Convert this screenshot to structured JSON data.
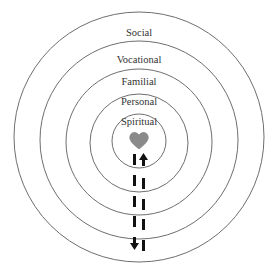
{
  "diagram": {
    "type": "concentric-circles",
    "rings": [
      {
        "id": "social",
        "label": "Social",
        "cx": 139,
        "cy": 137,
        "r": 125,
        "label_y": 35
      },
      {
        "id": "vocational",
        "label": "Vocational",
        "cx": 139,
        "cy": 140,
        "r": 99,
        "label_y": 62
      },
      {
        "id": "familial",
        "label": "Familial",
        "cx": 139,
        "cy": 142,
        "r": 73,
        "label_y": 84
      },
      {
        "id": "personal",
        "label": "Personal",
        "cx": 139,
        "cy": 143,
        "r": 49,
        "label_y": 104
      },
      {
        "id": "spiritual",
        "label": "Spiritual",
        "cx": 139,
        "cy": 141,
        "r": 27,
        "label_y": 124
      }
    ],
    "center_icon": "heart-icon",
    "center_icon_color": "#8a8a8a",
    "arrows": {
      "up_label": "up-arrow",
      "down_label": "down-arrow",
      "direction_note": "bidirectional flow between center and outer ring"
    },
    "colors": {
      "stroke": "#6e6e6e",
      "text": "#333333",
      "bars": "#111111"
    }
  }
}
